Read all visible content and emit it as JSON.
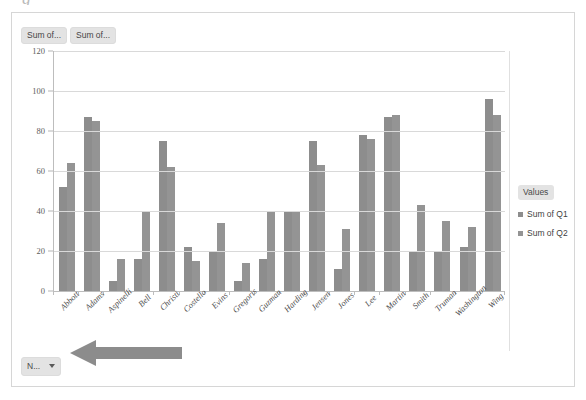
{
  "top_partial_glyph": "g",
  "field_buttons": [
    {
      "label": "Sum of...",
      "name": "field-button-sum-of-q1"
    },
    {
      "label": "Sum of...",
      "name": "field-button-sum-of-q2"
    }
  ],
  "bottom_field_button": {
    "label": "N...",
    "icon": "chevron-down-icon"
  },
  "legend": {
    "title": "Values",
    "items": [
      {
        "label": "Sum of Q1",
        "color": "#8d8d8d"
      },
      {
        "label": "Sum of Q2",
        "color": "#949494"
      }
    ]
  },
  "annotation": {
    "arrow_icon": "left-arrow-icon",
    "color": "#8c8c8c"
  },
  "chart_data": {
    "type": "bar",
    "title": "",
    "xlabel": "",
    "ylabel": "",
    "ylim": [
      0,
      120
    ],
    "yticks": [
      0,
      20,
      40,
      60,
      80,
      100,
      120
    ],
    "grid": true,
    "legend_position": "right",
    "categories": [
      "Abbott",
      "Adams",
      "Aspinelli",
      "Bell",
      "Christi",
      "Costello",
      "Evins",
      "Gregoris",
      "Guzman",
      "Harding",
      "Jensen",
      "Jones",
      "Lee",
      "Martin",
      "Smith",
      "Truman",
      "Washington",
      "Wing"
    ],
    "series": [
      {
        "name": "Sum of Q1",
        "color": "#8d8d8d",
        "values": [
          52,
          87,
          5,
          16,
          75,
          22,
          20,
          5,
          16,
          40,
          75,
          11,
          78,
          87,
          20,
          20,
          22,
          96
        ]
      },
      {
        "name": "Sum of Q2",
        "color": "#949494",
        "values": [
          64,
          85,
          16,
          40,
          62,
          15,
          34,
          14,
          40,
          40,
          63,
          31,
          76,
          88,
          43,
          35,
          32,
          88
        ]
      }
    ]
  }
}
